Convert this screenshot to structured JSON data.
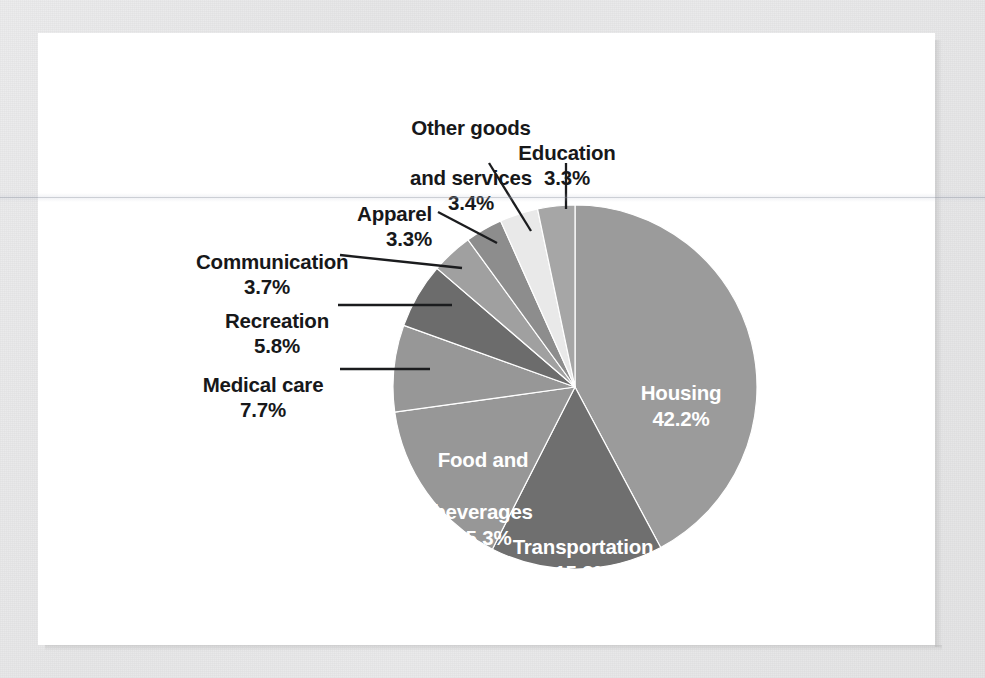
{
  "chart_data": {
    "type": "pie",
    "title": "",
    "subtitle": "",
    "xlabel": "",
    "ylabel": "",
    "legend_position": "none",
    "grid": false,
    "units": "percent",
    "total": 100.0,
    "start_angle_deg": 0,
    "direction": "clockwise",
    "categories": [
      "Housing",
      "Transportation",
      "Food and beverages",
      "Medical care",
      "Recreation",
      "Communication",
      "Apparel",
      "Other goods and services",
      "Education"
    ],
    "values": [
      42.2,
      15.3,
      15.3,
      7.7,
      5.8,
      3.7,
      3.3,
      3.4,
      3.3
    ],
    "slices": [
      {
        "label": "Housing",
        "label_line1": "Housing",
        "label_line2": "",
        "value": 42.2,
        "pct_text": "42.2%",
        "color": "#9b9b9b",
        "label_placement": "inside"
      },
      {
        "label": "Transportation",
        "label_line1": "Transportation",
        "label_line2": "",
        "value": 15.3,
        "pct_text": "15.3%",
        "color": "#6f6f6f",
        "label_placement": "inside"
      },
      {
        "label": "Food and beverages",
        "label_line1": "Food and",
        "label_line2": "beverages",
        "value": 15.3,
        "pct_text": "15.3%",
        "color": "#979797",
        "label_placement": "inside"
      },
      {
        "label": "Medical care",
        "label_line1": "Medical care",
        "label_line2": "",
        "value": 7.7,
        "pct_text": "7.7%",
        "color": "#979797",
        "label_placement": "outside"
      },
      {
        "label": "Recreation",
        "label_line1": "Recreation",
        "label_line2": "",
        "value": 5.8,
        "pct_text": "5.8%",
        "color": "#6c6c6c",
        "label_placement": "outside"
      },
      {
        "label": "Communication",
        "label_line1": "Communication",
        "label_line2": "",
        "value": 3.7,
        "pct_text": "3.7%",
        "color": "#a0a0a0",
        "label_placement": "outside"
      },
      {
        "label": "Apparel",
        "label_line1": "Apparel",
        "label_line2": "",
        "value": 3.3,
        "pct_text": "3.3%",
        "color": "#8d8d8d",
        "label_placement": "outside"
      },
      {
        "label": "Other goods and services",
        "label_line1": "Other goods",
        "label_line2": "and services",
        "value": 3.4,
        "pct_text": "3.4%",
        "color": "#e9e9e9",
        "label_placement": "outside"
      },
      {
        "label": "Education",
        "label_line1": "Education",
        "label_line2": "",
        "value": 3.3,
        "pct_text": "3.3%",
        "color": "#a6a6a6",
        "label_placement": "outside"
      }
    ]
  },
  "labels": {
    "housing": {
      "name": "Housing",
      "pct": "42.2%"
    },
    "transportation": {
      "name": "Transportation",
      "pct": "15.3%"
    },
    "food": {
      "line1": "Food and",
      "line2": "beverages",
      "pct": "15.3%"
    },
    "medical": {
      "name": "Medical care",
      "pct": "7.7%"
    },
    "recreation": {
      "name": "Recreation",
      "pct": "5.8%"
    },
    "communication": {
      "name": "Communication",
      "pct": "3.7%"
    },
    "apparel": {
      "name": "Apparel",
      "pct": "3.3%"
    },
    "other_goods": {
      "line1": "Other goods",
      "line2": "and services",
      "pct": "3.4%"
    },
    "education": {
      "name": "Education",
      "pct": "3.3%"
    }
  },
  "geometry": {
    "center_x": 575,
    "center_y": 387,
    "radius": 182
  },
  "colors": {
    "panel_background": "#ffffff",
    "page_background": "#e9e9e9",
    "label_text": "#17181a",
    "inner_label_text": "#ffffff",
    "leader_line": "#1b1c1e"
  }
}
